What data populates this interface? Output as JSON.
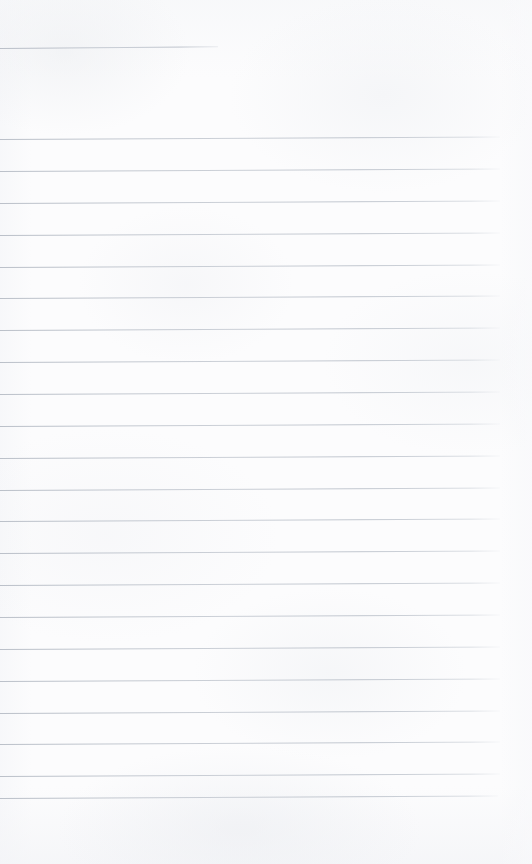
{
  "document": {
    "kind": "scanned-blank-lined-page",
    "title": "",
    "body_text": "",
    "page_number": "",
    "heading": "",
    "notes": ""
  },
  "page": {
    "width": 532,
    "height": 864,
    "paper_color": "#fcfcfd",
    "rule_color": "#bcc2cb",
    "rule_thickness_px": 1
  },
  "rules": {
    "header_rule": {
      "label": "header-rule",
      "x": 0,
      "y": 48,
      "width": 218,
      "tilt_deg": -0.45
    },
    "body_rules": [
      {
        "label": "rule-01",
        "x": 0,
        "y": 139,
        "width": 500,
        "tilt_deg": -0.3
      },
      {
        "label": "rule-02",
        "x": 0,
        "y": 171,
        "width": 500,
        "tilt_deg": -0.3
      },
      {
        "label": "rule-03",
        "x": 0,
        "y": 203,
        "width": 500,
        "tilt_deg": -0.3
      },
      {
        "label": "rule-04",
        "x": 0,
        "y": 235,
        "width": 500,
        "tilt_deg": -0.3
      },
      {
        "label": "rule-05",
        "x": 0,
        "y": 267,
        "width": 500,
        "tilt_deg": -0.3
      },
      {
        "label": "rule-06",
        "x": 0,
        "y": 298,
        "width": 500,
        "tilt_deg": -0.3
      },
      {
        "label": "rule-07",
        "x": 0,
        "y": 330,
        "width": 500,
        "tilt_deg": -0.3
      },
      {
        "label": "rule-08",
        "x": 0,
        "y": 362,
        "width": 500,
        "tilt_deg": -0.3
      },
      {
        "label": "rule-09",
        "x": 0,
        "y": 394,
        "width": 500,
        "tilt_deg": -0.3
      },
      {
        "label": "rule-10",
        "x": 0,
        "y": 426,
        "width": 500,
        "tilt_deg": -0.3
      },
      {
        "label": "rule-11",
        "x": 0,
        "y": 458,
        "width": 500,
        "tilt_deg": -0.3
      },
      {
        "label": "rule-12",
        "x": 0,
        "y": 490,
        "width": 500,
        "tilt_deg": -0.3
      },
      {
        "label": "rule-13",
        "x": 0,
        "y": 521,
        "width": 500,
        "tilt_deg": -0.3
      },
      {
        "label": "rule-14",
        "x": 0,
        "y": 553,
        "width": 500,
        "tilt_deg": -0.3
      },
      {
        "label": "rule-15",
        "x": 0,
        "y": 585,
        "width": 500,
        "tilt_deg": -0.3
      },
      {
        "label": "rule-16",
        "x": 0,
        "y": 617,
        "width": 500,
        "tilt_deg": -0.3
      },
      {
        "label": "rule-17",
        "x": 0,
        "y": 649,
        "width": 500,
        "tilt_deg": -0.3
      },
      {
        "label": "rule-18",
        "x": 0,
        "y": 681,
        "width": 500,
        "tilt_deg": -0.3
      },
      {
        "label": "rule-19",
        "x": 0,
        "y": 713,
        "width": 500,
        "tilt_deg": -0.3
      },
      {
        "label": "rule-20",
        "x": 0,
        "y": 744,
        "width": 500,
        "tilt_deg": -0.3
      },
      {
        "label": "rule-21",
        "x": 0,
        "y": 776,
        "width": 500,
        "tilt_deg": -0.3
      },
      {
        "label": "rule-22",
        "x": 0,
        "y": 798,
        "width": 498,
        "tilt_deg": -0.3
      }
    ]
  }
}
